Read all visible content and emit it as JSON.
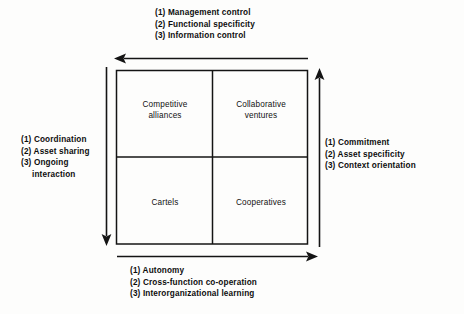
{
  "diagram": {
    "colors": {
      "line": "#141414",
      "background": "#fdfdfc",
      "text": "#111111"
    },
    "axes": {
      "top": {
        "direction": "left",
        "lines": [
          "(1) Management control",
          "(2) Functional specificity",
          "(3) Information control"
        ]
      },
      "left": {
        "direction": "down",
        "lines": [
          "(1) Coordination",
          "(2) Asset sharing",
          "(3) Ongoing",
          "interaction"
        ]
      },
      "right": {
        "direction": "up",
        "lines": [
          "(1) Commitment",
          "(2) Asset specificity",
          "(3) Context orientation"
        ]
      },
      "bottom": {
        "direction": "right",
        "lines": [
          "(1) Autonomy",
          "(2) Cross-function co-operation",
          "(3) Interorganizational learning"
        ]
      }
    },
    "quadrants": [
      {
        "id": "top-left",
        "lines": [
          "Competitive",
          "alliances"
        ]
      },
      {
        "id": "top-right",
        "lines": [
          "Collaborative",
          "ventures"
        ]
      },
      {
        "id": "bottom-left",
        "lines": [
          "Cartels"
        ]
      },
      {
        "id": "bottom-right",
        "lines": [
          "Cooperatives"
        ]
      }
    ]
  }
}
